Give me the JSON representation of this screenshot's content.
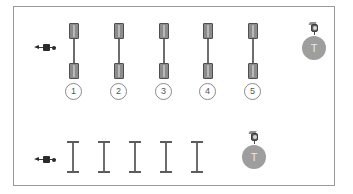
{
  "diagram": {
    "background_color": "#ffffff",
    "frame_border_color": "#9a9a9a",
    "accent_gray": "#8c8c8c",
    "stroke_dark": "#4f4f4f",
    "badge_fill": "#9e9e9e",
    "callout_text_color": "#555555",
    "rows": [
      {
        "row_name": "upper-row",
        "marker": {
          "icon": "left-arrow-marker-icon",
          "label": ""
        },
        "specimens": [
          {
            "id": "specimen-1",
            "shape": "dumbbell",
            "callout": "1"
          },
          {
            "id": "specimen-2",
            "shape": "dumbbell",
            "callout": "2"
          },
          {
            "id": "specimen-3",
            "shape": "dumbbell",
            "callout": "3"
          },
          {
            "id": "specimen-4",
            "shape": "dumbbell",
            "callout": "4"
          },
          {
            "id": "specimen-5",
            "shape": "dumbbell",
            "callout": "5"
          }
        ],
        "badge": {
          "pin_icon": "camera-pin-icon",
          "letter": "T"
        }
      },
      {
        "row_name": "lower-row",
        "marker": {
          "icon": "left-arrow-marker-icon",
          "label": ""
        },
        "specimens": [
          {
            "id": "specimen-6",
            "shape": "ibeam",
            "callout": ""
          },
          {
            "id": "specimen-7",
            "shape": "ibeam",
            "callout": ""
          },
          {
            "id": "specimen-8",
            "shape": "ibeam",
            "callout": ""
          },
          {
            "id": "specimen-9",
            "shape": "ibeam",
            "callout": ""
          },
          {
            "id": "specimen-10",
            "shape": "ibeam",
            "callout": ""
          }
        ],
        "badge": {
          "pin_icon": "camera-pin-icon",
          "letter": "T"
        }
      }
    ]
  }
}
